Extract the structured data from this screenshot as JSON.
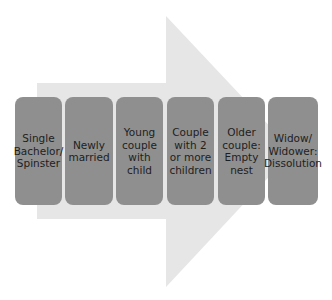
{
  "diagram": {
    "type": "process-arrow",
    "colors": {
      "arrow": "#e6e6e6",
      "stage_box": "#8f8f8f",
      "text": "#1e1e1e",
      "background": "#ffffff"
    },
    "stages": [
      {
        "label": "Single\nBachelor/\nSpinster"
      },
      {
        "label": "Newly\nmarried"
      },
      {
        "label": "Young\ncouple\nwith\nchild"
      },
      {
        "label": "Couple\nwith 2\nor more\nchildren"
      },
      {
        "label": "Older\ncouple:\nEmpty\nnest"
      },
      {
        "label": "Widow/\nWidower:\nDissolution"
      }
    ]
  }
}
